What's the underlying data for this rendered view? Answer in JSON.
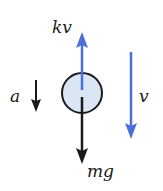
{
  "diagram": {
    "colors": {
      "force_blue": "#4a6fd8",
      "black": "#1a1a1a",
      "body_fill": "#dbe6f5"
    },
    "body": {
      "shape": "circle",
      "cx": 82,
      "cy": 93,
      "r": 20
    },
    "forces": [
      {
        "id": "drag",
        "label": "kv",
        "direction": "up",
        "color": "blue"
      },
      {
        "id": "weight",
        "label": "mg",
        "direction": "down",
        "color": "black"
      }
    ],
    "acceleration": {
      "label": "a",
      "direction": "down"
    },
    "velocity": {
      "label": "v",
      "direction": "down"
    }
  }
}
